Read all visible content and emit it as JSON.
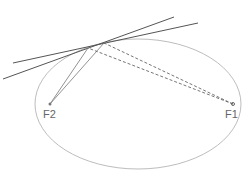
{
  "diagram": {
    "colors": {
      "ellipse": "#bdbdbd",
      "tangent": "#555555",
      "solid_ray": "#777777",
      "dashed_ray": "#666666",
      "label": "#666666"
    },
    "ellipse": {
      "cx": 138,
      "cy": 104,
      "rx": 103,
      "ry": 65
    },
    "foci": [
      {
        "id": "F2",
        "label": "F2",
        "x": 50,
        "y": 104,
        "label_x": 43,
        "label_y": 118
      },
      {
        "id": "F1",
        "label": "F1",
        "x": 233,
        "y": 104,
        "label_x": 225,
        "label_y": 118
      }
    ],
    "tangent_points": [
      {
        "x": 88,
        "y": 48
      },
      {
        "x": 104,
        "y": 43
      }
    ],
    "tangent_lines": [
      {
        "x1": 13,
        "y1": 63,
        "x2": 198,
        "y2": 23
      },
      {
        "x1": 3,
        "y1": 79,
        "x2": 174,
        "y2": 17
      }
    ]
  }
}
